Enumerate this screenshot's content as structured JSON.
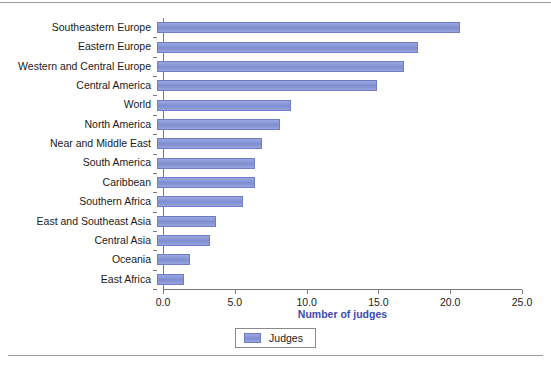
{
  "chart_data": {
    "type": "bar",
    "orientation": "horizontal",
    "title": "",
    "xlabel": "Number of judges",
    "ylabel": "",
    "xlim": [
      0,
      25
    ],
    "xticks": [
      "0.0",
      "5.0",
      "10.0",
      "15.0",
      "20.0",
      "25.0"
    ],
    "xtick_values": [
      0,
      5,
      10,
      15,
      20,
      25
    ],
    "grid": false,
    "legend": {
      "position": "bottom-center",
      "entries": [
        {
          "label": "Judges",
          "color": "#8a98d6"
        }
      ]
    },
    "categories": [
      "Southeastern Europe",
      "Eastern Europe",
      "Western and Central Europe",
      "Central America",
      "World",
      "North America",
      "Near and Middle East",
      "South America",
      "Caribbean",
      "Southern Africa",
      "East and Southeast Asia",
      "Central Asia",
      "Oceania",
      "East Africa"
    ],
    "values": [
      21.1,
      18.2,
      17.2,
      15.3,
      9.3,
      8.6,
      7.3,
      6.8,
      6.8,
      6.0,
      4.1,
      3.7,
      2.3,
      1.9
    ],
    "series": [
      {
        "name": "Judges",
        "values": [
          21.1,
          18.2,
          17.2,
          15.3,
          9.3,
          8.6,
          7.3,
          6.8,
          6.8,
          6.0,
          4.1,
          3.7,
          2.3,
          1.9
        ]
      }
    ],
    "colors": {
      "bar_fill": "#8a98d6",
      "bar_border": "#6f7dc4",
      "axis": "#7a7a7a",
      "axis_title": "#3a4ab0",
      "tick_text": "#1a1a1a"
    }
  }
}
